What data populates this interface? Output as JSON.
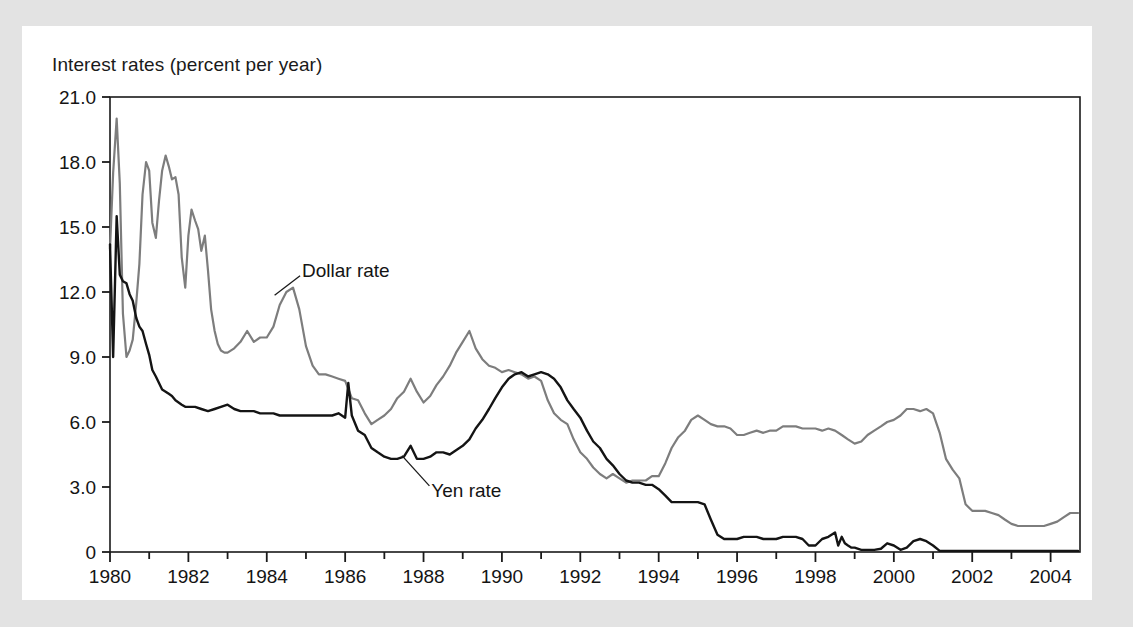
{
  "figure": {
    "axis_title": "Interest rates (percent per year)",
    "background_color": "#e3e3e3",
    "card_color": "#ffffff"
  },
  "chart_data": {
    "type": "line",
    "title": "",
    "subtitle": "",
    "xlabel": "",
    "ylabel": "Interest rates (percent per year)",
    "xlim": [
      1980,
      2004.75
    ],
    "ylim": [
      0,
      21
    ],
    "grid": false,
    "legend": "annotations-on-plot",
    "y_ticks": [
      0,
      3,
      6,
      9,
      12,
      15,
      18,
      21
    ],
    "y_tick_labels": [
      "0",
      "3.0",
      "6.0",
      "9.0",
      "12.0",
      "15.0",
      "18.0",
      "21.0"
    ],
    "x_ticks": [
      1980,
      1981,
      1982,
      1983,
      1984,
      1985,
      1986,
      1987,
      1988,
      1989,
      1990,
      1991,
      1992,
      1993,
      1994,
      1995,
      1996,
      1997,
      1998,
      1999,
      2000,
      2001,
      2002,
      2003,
      2004
    ],
    "x_tick_labels": [
      "1980",
      "",
      "1982",
      "",
      "1984",
      "",
      "1986",
      "",
      "1988",
      "",
      "1990",
      "",
      "1992",
      "",
      "1994",
      "",
      "1996",
      "",
      "1998",
      "",
      "2000",
      "",
      "2002",
      "",
      "2004"
    ],
    "annotations": [
      {
        "text": "Dollar rate",
        "x": 1984.9,
        "y": 13.0,
        "series": "Dollar rate",
        "leader_from": [
          1984.85,
          12.75
        ],
        "leader_to": [
          1984.2,
          11.85
        ]
      },
      {
        "text": "Yen rate",
        "x": 1988.2,
        "y": 2.85,
        "series": "Yen rate",
        "leader_from": [
          1988.15,
          3.05
        ],
        "leader_to": [
          1987.45,
          4.45
        ]
      }
    ],
    "series": [
      {
        "name": "Dollar rate",
        "color": "#7d7d7d",
        "width": 2.2,
        "x": [
          1980.0,
          1980.08,
          1980.17,
          1980.25,
          1980.33,
          1980.42,
          1980.5,
          1980.58,
          1980.67,
          1980.75,
          1980.83,
          1980.92,
          1981.0,
          1981.08,
          1981.17,
          1981.25,
          1981.33,
          1981.42,
          1981.5,
          1981.58,
          1981.67,
          1981.75,
          1981.83,
          1981.92,
          1982.0,
          1982.08,
          1982.17,
          1982.25,
          1982.33,
          1982.42,
          1982.5,
          1982.58,
          1982.67,
          1982.75,
          1982.83,
          1982.92,
          1983.0,
          1983.17,
          1983.33,
          1983.5,
          1983.67,
          1983.83,
          1984.0,
          1984.17,
          1984.33,
          1984.5,
          1984.67,
          1984.83,
          1985.0,
          1985.17,
          1985.33,
          1985.5,
          1985.67,
          1985.83,
          1986.0,
          1986.17,
          1986.33,
          1986.5,
          1986.67,
          1986.83,
          1987.0,
          1987.17,
          1987.33,
          1987.5,
          1987.67,
          1987.83,
          1988.0,
          1988.17,
          1988.33,
          1988.5,
          1988.67,
          1988.83,
          1989.0,
          1989.17,
          1989.33,
          1989.5,
          1989.67,
          1989.83,
          1990.0,
          1990.17,
          1990.33,
          1990.5,
          1990.67,
          1990.83,
          1991.0,
          1991.17,
          1991.33,
          1991.5,
          1991.67,
          1991.83,
          1992.0,
          1992.17,
          1992.33,
          1992.5,
          1992.67,
          1992.83,
          1993.0,
          1993.17,
          1993.33,
          1993.5,
          1993.67,
          1993.83,
          1994.0,
          1994.17,
          1994.33,
          1994.5,
          1994.67,
          1994.83,
          1995.0,
          1995.17,
          1995.33,
          1995.5,
          1995.67,
          1995.83,
          1996.0,
          1996.17,
          1996.33,
          1996.5,
          1996.67,
          1996.83,
          1997.0,
          1997.17,
          1997.33,
          1997.5,
          1997.67,
          1997.83,
          1998.0,
          1998.17,
          1998.33,
          1998.5,
          1998.67,
          1998.83,
          1999.0,
          1999.17,
          1999.33,
          1999.5,
          1999.67,
          1999.83,
          2000.0,
          2000.17,
          2000.33,
          2000.5,
          2000.67,
          2000.83,
          2001.0,
          2001.17,
          2001.33,
          2001.5,
          2001.67,
          2001.83,
          2002.0,
          2002.17,
          2002.33,
          2002.5,
          2002.67,
          2002.83,
          2003.0,
          2003.17,
          2003.33,
          2003.5,
          2003.67,
          2003.83,
          2004.0,
          2004.17,
          2004.33,
          2004.5,
          2004.7
        ],
        "y": [
          14.0,
          17.5,
          20.0,
          17.0,
          11.0,
          9.0,
          9.3,
          9.8,
          11.5,
          13.3,
          16.5,
          18.0,
          17.6,
          15.2,
          14.5,
          16.2,
          17.6,
          18.3,
          17.8,
          17.2,
          17.3,
          16.5,
          13.6,
          12.2,
          14.6,
          15.8,
          15.3,
          14.9,
          13.9,
          14.6,
          13.0,
          11.2,
          10.2,
          9.6,
          9.3,
          9.2,
          9.2,
          9.4,
          9.7,
          10.2,
          9.7,
          9.9,
          9.9,
          10.4,
          11.4,
          12.0,
          12.2,
          11.2,
          9.5,
          8.6,
          8.2,
          8.2,
          8.1,
          8.0,
          7.9,
          7.1,
          7.0,
          6.4,
          5.9,
          6.1,
          6.3,
          6.6,
          7.1,
          7.4,
          8.0,
          7.4,
          6.9,
          7.2,
          7.7,
          8.1,
          8.6,
          9.2,
          9.7,
          10.2,
          9.4,
          8.9,
          8.6,
          8.5,
          8.3,
          8.4,
          8.3,
          8.2,
          8.0,
          8.1,
          7.9,
          7.0,
          6.4,
          6.1,
          5.9,
          5.2,
          4.6,
          4.3,
          3.9,
          3.6,
          3.4,
          3.6,
          3.4,
          3.2,
          3.3,
          3.3,
          3.3,
          3.5,
          3.5,
          4.1,
          4.8,
          5.3,
          5.6,
          6.1,
          6.3,
          6.1,
          5.9,
          5.8,
          5.8,
          5.7,
          5.4,
          5.4,
          5.5,
          5.6,
          5.5,
          5.6,
          5.6,
          5.8,
          5.8,
          5.8,
          5.7,
          5.7,
          5.7,
          5.6,
          5.7,
          5.6,
          5.4,
          5.2,
          5.0,
          5.1,
          5.4,
          5.6,
          5.8,
          6.0,
          6.1,
          6.3,
          6.6,
          6.6,
          6.5,
          6.6,
          6.4,
          5.5,
          4.3,
          3.8,
          3.4,
          2.2,
          1.9,
          1.9,
          1.9,
          1.8,
          1.7,
          1.5,
          1.3,
          1.2,
          1.2,
          1.2,
          1.2,
          1.2,
          1.3,
          1.4,
          1.6,
          1.8,
          1.8
        ]
      },
      {
        "name": "Yen rate",
        "color": "#141414",
        "width": 2.4,
        "x": [
          1980.0,
          1980.08,
          1980.17,
          1980.25,
          1980.33,
          1980.42,
          1980.5,
          1980.58,
          1980.67,
          1980.75,
          1980.83,
          1980.92,
          1981.0,
          1981.08,
          1981.17,
          1981.25,
          1981.33,
          1981.42,
          1981.5,
          1981.58,
          1981.67,
          1981.75,
          1981.83,
          1981.92,
          1982.0,
          1982.17,
          1982.33,
          1982.5,
          1982.67,
          1982.83,
          1983.0,
          1983.17,
          1983.33,
          1983.5,
          1983.67,
          1983.83,
          1984.0,
          1984.17,
          1984.33,
          1984.5,
          1984.67,
          1984.83,
          1985.0,
          1985.17,
          1985.33,
          1985.5,
          1985.67,
          1985.83,
          1986.0,
          1986.08,
          1986.17,
          1986.33,
          1986.5,
          1986.67,
          1986.83,
          1987.0,
          1987.17,
          1987.33,
          1987.5,
          1987.67,
          1987.83,
          1988.0,
          1988.17,
          1988.33,
          1988.5,
          1988.67,
          1988.83,
          1989.0,
          1989.17,
          1989.33,
          1989.5,
          1989.67,
          1989.83,
          1990.0,
          1990.17,
          1990.33,
          1990.5,
          1990.67,
          1990.83,
          1991.0,
          1991.17,
          1991.33,
          1991.5,
          1991.67,
          1991.83,
          1992.0,
          1992.17,
          1992.33,
          1992.5,
          1992.67,
          1992.83,
          1993.0,
          1993.17,
          1993.33,
          1993.5,
          1993.67,
          1993.83,
          1994.0,
          1994.17,
          1994.33,
          1994.5,
          1994.67,
          1994.83,
          1995.0,
          1995.17,
          1995.33,
          1995.5,
          1995.67,
          1995.83,
          1996.0,
          1996.17,
          1996.33,
          1996.5,
          1996.67,
          1996.83,
          1997.0,
          1997.17,
          1997.33,
          1997.5,
          1997.67,
          1997.83,
          1998.0,
          1998.17,
          1998.33,
          1998.5,
          1998.58,
          1998.67,
          1998.75,
          1998.83,
          1998.92,
          1999.0,
          1999.17,
          1999.33,
          1999.5,
          1999.67,
          1999.83,
          2000.0,
          2000.17,
          2000.33,
          2000.5,
          2000.67,
          2000.83,
          2001.0,
          2001.17,
          2001.33,
          2001.5,
          2001.67,
          2001.83,
          2002.0,
          2002.33,
          2002.67,
          2003.0,
          2003.33,
          2003.67,
          2004.0,
          2004.33,
          2004.7
        ],
        "y": [
          14.2,
          9.0,
          15.5,
          12.8,
          12.5,
          12.4,
          11.9,
          11.6,
          10.8,
          10.4,
          10.2,
          9.6,
          9.1,
          8.4,
          8.1,
          7.8,
          7.5,
          7.4,
          7.3,
          7.2,
          7.0,
          6.9,
          6.8,
          6.7,
          6.7,
          6.7,
          6.6,
          6.5,
          6.6,
          6.7,
          6.8,
          6.6,
          6.5,
          6.5,
          6.5,
          6.4,
          6.4,
          6.4,
          6.3,
          6.3,
          6.3,
          6.3,
          6.3,
          6.3,
          6.3,
          6.3,
          6.3,
          6.4,
          6.2,
          7.8,
          6.3,
          5.6,
          5.4,
          4.8,
          4.6,
          4.4,
          4.3,
          4.3,
          4.4,
          4.9,
          4.3,
          4.3,
          4.4,
          4.6,
          4.6,
          4.5,
          4.7,
          4.9,
          5.2,
          5.7,
          6.1,
          6.6,
          7.1,
          7.6,
          8.0,
          8.2,
          8.3,
          8.1,
          8.2,
          8.3,
          8.2,
          8.0,
          7.6,
          7.0,
          6.6,
          6.2,
          5.6,
          5.1,
          4.8,
          4.3,
          4.0,
          3.6,
          3.3,
          3.2,
          3.2,
          3.1,
          3.1,
          2.9,
          2.6,
          2.3,
          2.3,
          2.3,
          2.3,
          2.3,
          2.2,
          1.5,
          0.8,
          0.6,
          0.6,
          0.6,
          0.7,
          0.7,
          0.7,
          0.6,
          0.6,
          0.6,
          0.7,
          0.7,
          0.7,
          0.6,
          0.3,
          0.3,
          0.6,
          0.7,
          0.9,
          0.3,
          0.7,
          0.4,
          0.3,
          0.2,
          0.2,
          0.1,
          0.1,
          0.1,
          0.15,
          0.4,
          0.3,
          0.1,
          0.2,
          0.5,
          0.6,
          0.5,
          0.3,
          0.05,
          0.05,
          0.05,
          0.05,
          0.05,
          0.05,
          0.05,
          0.05,
          0.05,
          0.05,
          0.05,
          0.05,
          0.05,
          0.05
        ]
      }
    ]
  }
}
